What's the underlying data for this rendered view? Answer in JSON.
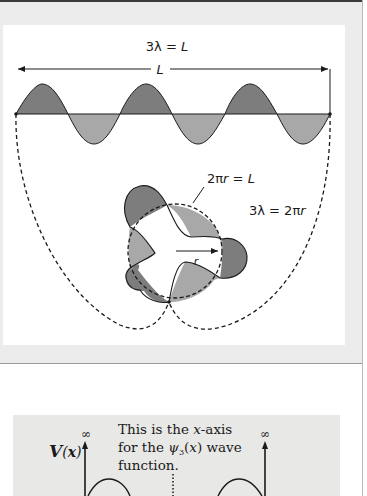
{
  "figure_top": {
    "title_equation": "3λ = L",
    "length_label": "L",
    "circumference_equation": "2πr = L",
    "wavelength_circle_equation": "3λ = 2πr",
    "radius_label": "r",
    "wavelengths": 3,
    "colors": {
      "crest_fill": "#7d7d7d",
      "trough_fill": "#a8a8a8",
      "stroke": "#1a1a1a",
      "panel_bg": "#ececec",
      "card_bg": "#ffffff"
    }
  },
  "figure_bottom": {
    "potential_label": "V(x)",
    "left_wall_value": "∞",
    "right_wall_value": "∞",
    "annotation_line1": "This is the x-axis",
    "annotation_line2": "for the ψ3(x) wave",
    "annotation_line3": "function.",
    "colors": {
      "panel_bg": "#e8e8e6",
      "stroke": "#1a1a1a"
    }
  }
}
